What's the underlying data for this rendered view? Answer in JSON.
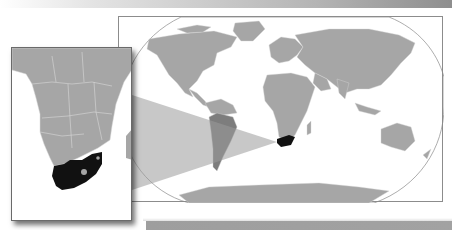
{
  "map": {
    "highlighted_country": "South Africa",
    "projection": "Robinson",
    "colors": {
      "land": "#a6a6a6",
      "border_lines": "#d8d8d8",
      "highlight": "#111111",
      "zoom_wedge": "#9a9a9a",
      "frame": "#8c8c8c",
      "background": "#ffffff"
    },
    "inset": {
      "region": "Southern Africa",
      "highlight": "South Africa"
    }
  }
}
